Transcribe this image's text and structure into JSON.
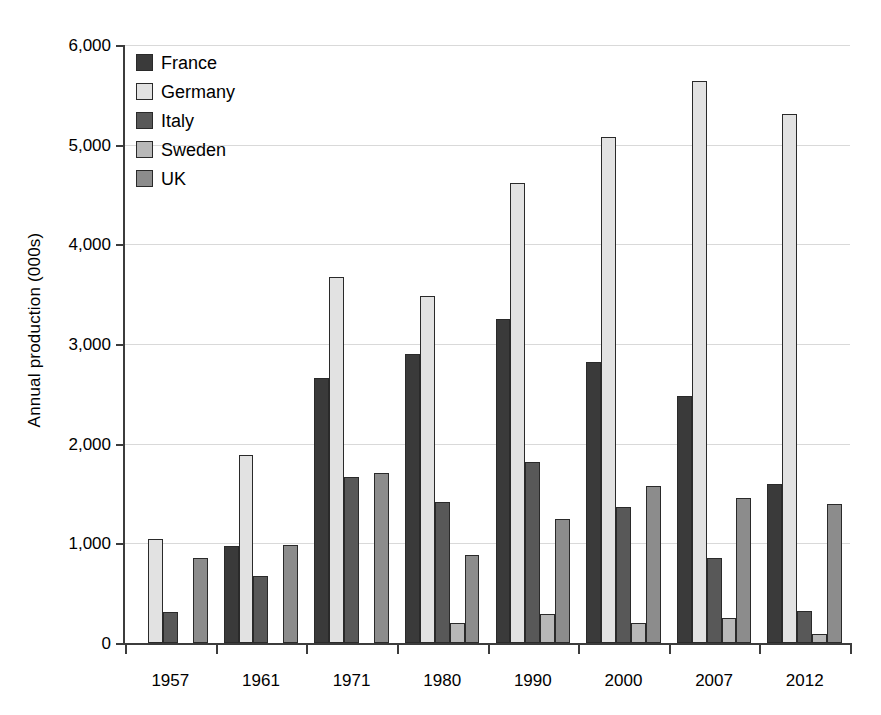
{
  "chart_data": {
    "type": "bar",
    "title": "",
    "xlabel": "",
    "ylabel": "Annual production (000s)",
    "categories": [
      "1957",
      "1961",
      "1971",
      "1980",
      "1990",
      "2000",
      "2007",
      "2012"
    ],
    "ylim": [
      0,
      6000
    ],
    "ytick_labels": [
      "0",
      "1,000",
      "2,000",
      "3,000",
      "4,000",
      "5,000",
      "6,000"
    ],
    "ytick_values": [
      0,
      1000,
      2000,
      3000,
      4000,
      5000,
      6000
    ],
    "grid": true,
    "legend_position": "upper-left-inside",
    "series": [
      {
        "name": "France",
        "color": "#3a3a3a",
        "values": [
          null,
          975,
          2660,
          2900,
          3250,
          2820,
          2480,
          1600
        ]
      },
      {
        "name": "Germany",
        "color": "#e2e2e2",
        "values": [
          1040,
          1890,
          3670,
          3480,
          4620,
          5080,
          5640,
          5310
        ]
      },
      {
        "name": "Italy",
        "color": "#585858",
        "values": [
          310,
          675,
          1670,
          1410,
          1820,
          1360,
          850,
          320
        ]
      },
      {
        "name": "Sweden",
        "color": "#b8b8b8",
        "values": [
          null,
          null,
          null,
          200,
          290,
          205,
          250,
          90
        ]
      },
      {
        "name": "UK",
        "color": "#8c8c8c",
        "values": [
          855,
          985,
          1710,
          885,
          1240,
          1580,
          1460,
          1390
        ]
      }
    ]
  },
  "legend": {
    "items": [
      {
        "label": "France"
      },
      {
        "label": "Germany"
      },
      {
        "label": "Italy"
      },
      {
        "label": "Sweden"
      },
      {
        "label": "UK"
      }
    ]
  },
  "colors": {
    "axis": "#3c3c3c",
    "grid": "#d9d9d9",
    "bar_outline": "#2a2a2a",
    "background": "#ffffff"
  }
}
